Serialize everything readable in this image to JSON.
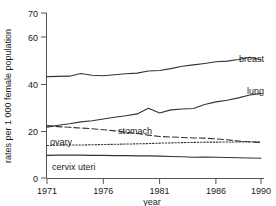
{
  "chart_data": {
    "type": "line",
    "title": "",
    "subtitle": "",
    "xlabel": "year",
    "ylabel": "rates per 1 000 female population",
    "xlim": [
      1971,
      1990
    ],
    "ylim": [
      0,
      70
    ],
    "grid": false,
    "legend_position": "inline-right",
    "x_ticks": [
      "1971",
      "1976",
      "1981",
      "1986",
      "1990"
    ],
    "x_tick_values": [
      1971,
      1976,
      1981,
      1986,
      1990
    ],
    "y_ticks": [
      "0",
      "20",
      "40",
      "60",
      "70"
    ],
    "y_tick_values": [
      0,
      20,
      40,
      60,
      70
    ],
    "x": [
      1971,
      1972,
      1973,
      1974,
      1975,
      1976,
      1977,
      1978,
      1979,
      1980,
      1981,
      1982,
      1983,
      1984,
      1985,
      1986,
      1987,
      1988,
      1989,
      1990
    ],
    "series": [
      {
        "name": "breast",
        "label": "breast",
        "style": "solid",
        "color": "#333333",
        "values": [
          43.0,
          43.1,
          43.2,
          44.3,
          43.6,
          43.4,
          43.8,
          44.2,
          44.5,
          45.4,
          45.6,
          46.4,
          47.4,
          48.0,
          48.6,
          49.3,
          49.6,
          50.3,
          51.2,
          50.2
        ]
      },
      {
        "name": "lung",
        "label": "lung",
        "style": "solid",
        "color": "#333333",
        "values": [
          21.6,
          22.4,
          23.0,
          23.8,
          24.3,
          25.0,
          25.8,
          26.4,
          27.2,
          29.6,
          27.6,
          28.9,
          29.3,
          29.5,
          31.2,
          32.3,
          33.0,
          34.0,
          35.2,
          35.8
        ]
      },
      {
        "name": "stomach",
        "label": "stomach",
        "style": "dashed",
        "color": "#333333",
        "values": [
          22.2,
          21.8,
          21.5,
          21.2,
          20.9,
          20.5,
          20.0,
          19.4,
          18.9,
          18.2,
          17.6,
          17.4,
          17.2,
          17.0,
          16.9,
          16.6,
          16.2,
          15.7,
          15.3,
          15.0
        ]
      },
      {
        "name": "ovary",
        "label": "ovary",
        "style": "dotted",
        "color": "#333333",
        "values": [
          13.8,
          13.9,
          14.0,
          14.0,
          14.1,
          14.2,
          14.3,
          14.4,
          14.5,
          14.6,
          14.8,
          14.9,
          15.0,
          15.1,
          15.2,
          15.2,
          15.3,
          15.3,
          15.4,
          15.4
        ]
      },
      {
        "name": "cervix uteri",
        "label": "cervix uteri",
        "style": "solid",
        "color": "#333333",
        "values": [
          9.6,
          9.7,
          9.7,
          9.7,
          9.6,
          9.6,
          9.5,
          9.5,
          9.4,
          9.4,
          9.3,
          9.1,
          9.0,
          8.8,
          8.9,
          8.8,
          8.7,
          8.6,
          8.5,
          8.4
        ]
      }
    ],
    "inline_labels": [
      {
        "name": "breast",
        "text": "breast",
        "x": 239,
        "y": 62
      },
      {
        "name": "lung",
        "text": "lung",
        "x": 247,
        "y": 94
      },
      {
        "name": "stomach",
        "text": "stomach",
        "x": 118,
        "y": 134
      },
      {
        "name": "ovary",
        "text": "ovary",
        "x": 50,
        "y": 145
      },
      {
        "name": "cervix uteri",
        "text": "cervix uteri",
        "x": 52,
        "y": 170
      }
    ]
  },
  "axes": {
    "y_label": "rates per 1 000 female population",
    "x_label": "year",
    "y_tick_0": "0",
    "y_tick_20": "20",
    "y_tick_40": "40",
    "y_tick_60": "60",
    "y_tick_70": "70",
    "x_tick_1971": "1971",
    "x_tick_1976": "1976",
    "x_tick_1981": "1981",
    "x_tick_1986": "1986",
    "x_tick_1990": "1990"
  },
  "colors": {
    "line": "#333333",
    "axis": "#555555",
    "text": "#1a1a1a",
    "background": "#ffffff"
  }
}
